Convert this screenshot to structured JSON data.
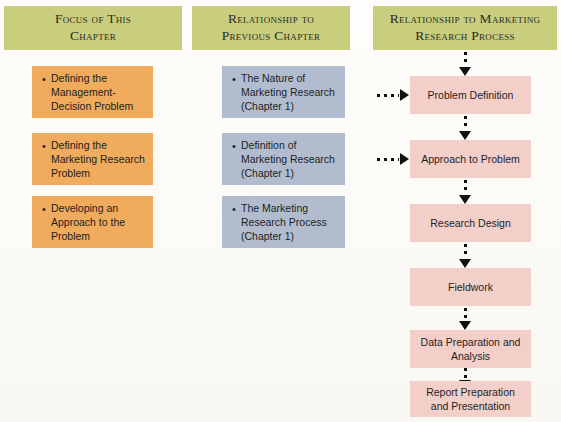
{
  "figure": {
    "background_color": "#fdfcf8",
    "header_color": "#c9ce7f",
    "column1_box_color": "#f0ab5c",
    "column2_box_color": "#b1bdcf",
    "column3_box_color": "#f3cfc9"
  },
  "columns": [
    {
      "header": {
        "line1": "Focus of This",
        "line2": "Chapter"
      },
      "items": [
        {
          "bullet": "•",
          "text": "Defining the Management-Decision Problem"
        },
        {
          "bullet": "•",
          "text": "Defining the Marketing Research Problem"
        },
        {
          "bullet": "•",
          "text": "Developing an Approach to the Problem"
        }
      ]
    },
    {
      "header": {
        "line1": "Relationship to",
        "line2": "Previous Chapter"
      },
      "items": [
        {
          "bullet": "•",
          "text": "The Nature of Marketing Research (Chapter 1)"
        },
        {
          "bullet": "•",
          "text": "Definition of Marketing Research (Chapter 1)"
        },
        {
          "bullet": "•",
          "text": "The Marketing Research Process (Chapter 1)"
        }
      ]
    },
    {
      "header": {
        "line1": "Relationship to Marketing",
        "line2": "Research Process"
      },
      "steps": [
        {
          "label": "Problem Definition"
        },
        {
          "label": "Approach to Problem"
        },
        {
          "label": "Research Design"
        },
        {
          "label": "Fieldwork"
        },
        {
          "label": "Data Preparation and Analysis"
        },
        {
          "label": "Report Preparation and Presentation"
        }
      ]
    }
  ]
}
